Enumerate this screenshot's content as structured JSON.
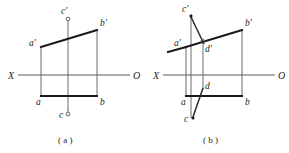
{
  "figure": {
    "title": "",
    "background": "#ffffff",
    "ink": "#1a1a1a",
    "axis_color": "#5a5a5a",
    "width": 289,
    "height": 153
  },
  "panel_a": {
    "caption": "( a )",
    "axis_left_label": "X",
    "axis_right_label": "O",
    "points": [
      {
        "name": "a-prime",
        "label": "a'",
        "x": 41,
        "y": 47,
        "label_x": 29,
        "label_y": 46
      },
      {
        "name": "b-prime",
        "label": "b'",
        "x": 97,
        "y": 30,
        "label_x": 100,
        "label_y": 26
      },
      {
        "name": "c-prime",
        "label": "c'",
        "x": 68,
        "y": 19,
        "label_x": 61,
        "label_y": 13
      },
      {
        "name": "a",
        "label": "a",
        "x": 41,
        "y": 96,
        "label_x": 36,
        "label_y": 104
      },
      {
        "name": "b",
        "label": "b",
        "x": 97,
        "y": 96,
        "label_x": 100,
        "label_y": 104
      },
      {
        "name": "c",
        "label": "c",
        "x": 68,
        "y": 114,
        "label_x": 60,
        "label_y": 119
      }
    ],
    "axis": {
      "x1": 18,
      "y1": 75,
      "x2": 130,
      "y2": 75
    },
    "quad": "41,47 97,30 97,96 41,96",
    "vertical_c": {
      "x": 68,
      "y1": 19,
      "y2": 114
    }
  },
  "panel_b": {
    "caption": "( b )",
    "axis_left_label": "X",
    "axis_right_label": "O",
    "points": [
      {
        "name": "a-prime",
        "label": "a'",
        "x": 186,
        "y": 47,
        "label_x": 174,
        "label_y": 46
      },
      {
        "name": "b-prime",
        "label": "b'",
        "x": 242,
        "y": 30,
        "label_x": 245,
        "label_y": 26
      },
      {
        "name": "c-prime",
        "label": "c'",
        "x": 191,
        "y": 16,
        "label_x": 183,
        "label_y": 11
      },
      {
        "name": "d-prime",
        "label": "d'",
        "x": 203,
        "y": 43,
        "label_x": 205,
        "label_y": 50
      },
      {
        "name": "a",
        "label": "a",
        "x": 186,
        "y": 96,
        "label_x": 181,
        "label_y": 104
      },
      {
        "name": "b",
        "label": "b",
        "x": 242,
        "y": 96,
        "label_x": 245,
        "label_y": 104
      },
      {
        "name": "c",
        "label": "c",
        "x": 193,
        "y": 118,
        "label_x": 185,
        "label_y": 120
      },
      {
        "name": "d",
        "label": "d",
        "x": 203,
        "y": 88,
        "label_x": 205,
        "label_y": 87
      }
    ],
    "axis": {
      "x1": 163,
      "y1": 75,
      "x2": 275,
      "y2": 75
    },
    "quad": "186,47 242,30 242,96 186,96",
    "vertical_c": {
      "x": 191,
      "y1": 16,
      "y2": 118
    },
    "vertical_d": {
      "x": 203,
      "y1": 43,
      "y2": 88
    },
    "seg_cd_front": {
      "x1": 191,
      "y1": 16,
      "x2": 203,
      "y2": 43
    },
    "seg_cd_top": {
      "x1": 193,
      "y1": 118,
      "x2": 203,
      "y2": 88
    }
  }
}
